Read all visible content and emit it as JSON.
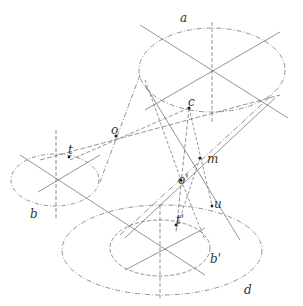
{
  "diagram": {
    "type": "geometric-projection",
    "labels": {
      "a": "a",
      "c": "c",
      "o": "o",
      "t": "t",
      "m": "m",
      "o_prime": "o'",
      "u": "u",
      "t_prime": "t'",
      "b_prime": "b'",
      "d": "d",
      "b": "b"
    },
    "colors": {
      "line": "#555555",
      "background": "#ffffff"
    }
  }
}
